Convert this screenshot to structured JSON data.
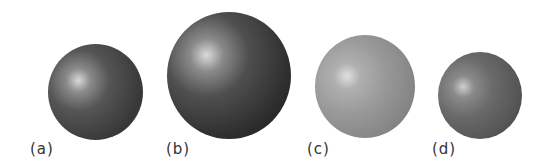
{
  "figure": {
    "spheres": [
      {
        "id": "a",
        "label": "(a)",
        "shade": "dark"
      },
      {
        "id": "b",
        "label": "(b)",
        "shade": "dark-large"
      },
      {
        "id": "c",
        "label": "(c)",
        "shade": "light"
      },
      {
        "id": "d",
        "label": "(d)",
        "shade": "medium-small"
      }
    ]
  }
}
